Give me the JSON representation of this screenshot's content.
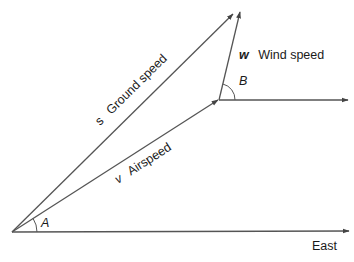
{
  "diagram": {
    "type": "vector-triangle",
    "colors": {
      "line": "#444444",
      "text": "#1a1a1a",
      "background": "#ffffff"
    },
    "vectors": {
      "ground_speed": {
        "symbol": "s",
        "label": "Ground speed"
      },
      "airspeed": {
        "symbol": "v",
        "label": "Airspeed"
      },
      "wind_speed": {
        "symbol": "w",
        "label": "Wind speed"
      }
    },
    "angles": {
      "A": "A",
      "B": "B"
    },
    "axis": {
      "east_label": "East"
    }
  }
}
